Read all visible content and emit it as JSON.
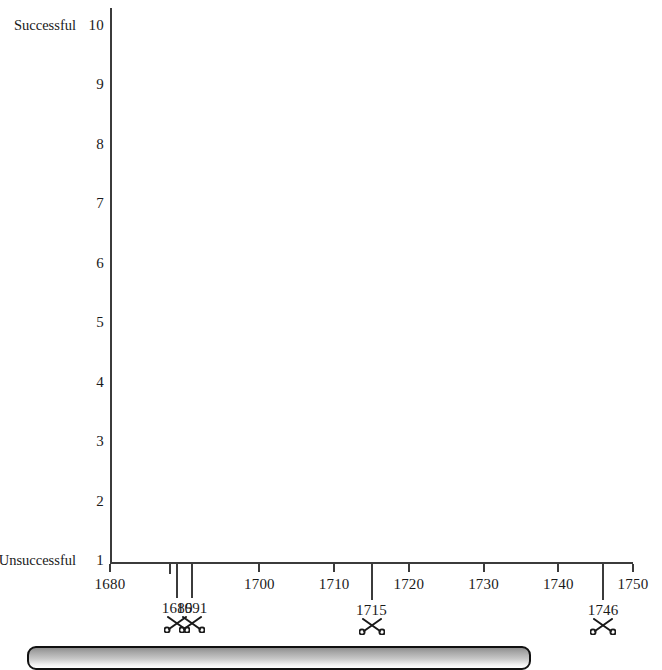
{
  "chart_data": {
    "type": "scatter",
    "title": "",
    "subtitle": "",
    "xlabel": "",
    "ylabel": "",
    "grid": false,
    "legend_position": "none",
    "xlim": [
      1680,
      1750
    ],
    "ylim": [
      1,
      10
    ],
    "x_ticks": [
      1680,
      1700,
      1710,
      1720,
      1730,
      1740,
      1750
    ],
    "x_tick_labels": [
      "1680",
      "1700",
      "1710",
      "1720",
      "1730",
      "1740",
      "1750"
    ],
    "y_ticks": [
      1,
      2,
      3,
      4,
      5,
      6,
      7,
      8,
      9,
      10
    ],
    "y_tick_labels": [
      "1",
      "2",
      "3",
      "4",
      "5",
      "6",
      "7",
      "8",
      "9",
      "10"
    ],
    "y_axis_low_label": "Unsuccessful",
    "y_axis_high_label": "Successful",
    "series": [
      {
        "name": "plotted points",
        "x": [],
        "y": []
      }
    ],
    "annotations": [
      {
        "year": 1689,
        "label": "1689",
        "icon": "crossed-swords-icon"
      },
      {
        "year": 1691,
        "label": "1691",
        "icon": "crossed-swords-icon"
      },
      {
        "year": 1715,
        "label": "1715",
        "icon": "crossed-swords-icon"
      },
      {
        "year": 1746,
        "label": "1746",
        "icon": "crossed-swords-icon"
      }
    ],
    "colors": {
      "axis": "#3b3b3b",
      "text": "#1a1a1a",
      "plot_background": "#ffffff",
      "bar_border": "#111111",
      "bar_fill_dark": "#8f8f8f",
      "bar_fill_light": "#ffffff"
    }
  },
  "y_axis": {
    "ticks": [
      {
        "value": "10",
        "end_label": "Successful"
      },
      {
        "value": "9",
        "end_label": ""
      },
      {
        "value": "8",
        "end_label": ""
      },
      {
        "value": "7",
        "end_label": ""
      },
      {
        "value": "6",
        "end_label": ""
      },
      {
        "value": "5",
        "end_label": ""
      },
      {
        "value": "4",
        "end_label": ""
      },
      {
        "value": "3",
        "end_label": ""
      },
      {
        "value": "2",
        "end_label": ""
      },
      {
        "value": "1",
        "end_label": "Unsuccessful"
      }
    ]
  },
  "x_axis": {
    "ticks": [
      {
        "label": "1680"
      },
      {
        "label": "1700"
      },
      {
        "label": "1710"
      },
      {
        "label": "1720"
      },
      {
        "label": "1730"
      },
      {
        "label": "1740"
      },
      {
        "label": "1750"
      }
    ]
  },
  "events": [
    {
      "label": "1689",
      "icon": "crossed-swords-icon"
    },
    {
      "label": "1691",
      "icon": "crossed-swords-icon"
    },
    {
      "label": "1715",
      "icon": "crossed-swords-icon"
    },
    {
      "label": "1746",
      "icon": "crossed-swords-icon"
    }
  ],
  "bottom_bar": {
    "label": ""
  }
}
